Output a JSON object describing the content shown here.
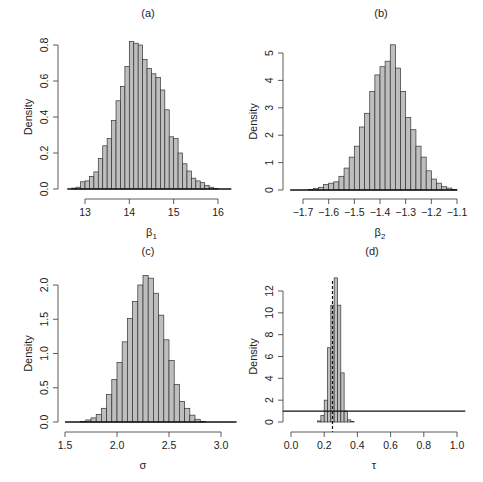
{
  "figure": {
    "panels_count": 4
  },
  "chart_data": [
    {
      "id": "a",
      "type": "bar",
      "title": "(a)",
      "xlabel": "β1",
      "xlabel_main": "β",
      "xlabel_sub": "1",
      "ylabel": "Density",
      "xlim": [
        12.6,
        16.3
      ],
      "ylim": [
        0,
        0.85
      ],
      "xticks": [
        13,
        14,
        15,
        16
      ],
      "xtick_labels": [
        "13",
        "14",
        "15",
        "16"
      ],
      "yticks": [
        0.0,
        0.2,
        0.4,
        0.6,
        0.8
      ],
      "ytick_labels": [
        "0.0",
        "0.2",
        "0.4",
        "0.6",
        "0.8"
      ],
      "bin_width": 0.1,
      "bins_start": [
        12.7,
        12.8,
        12.9,
        13.0,
        13.1,
        13.2,
        13.3,
        13.4,
        13.5,
        13.6,
        13.7,
        13.8,
        13.9,
        14.0,
        14.1,
        14.2,
        14.3,
        14.4,
        14.5,
        14.6,
        14.7,
        14.8,
        14.9,
        15.0,
        15.1,
        15.2,
        15.3,
        15.4,
        15.5,
        15.6,
        15.7,
        15.8,
        15.9
      ],
      "values": [
        0.005,
        0.01,
        0.04,
        0.045,
        0.07,
        0.095,
        0.17,
        0.24,
        0.28,
        0.38,
        0.49,
        0.57,
        0.68,
        0.82,
        0.81,
        0.8,
        0.72,
        0.67,
        0.64,
        0.62,
        0.55,
        0.44,
        0.29,
        0.28,
        0.2,
        0.14,
        0.1,
        0.06,
        0.045,
        0.035,
        0.02,
        0.01,
        0.003
      ],
      "hline": {
        "y": 0,
        "x0": 12.6,
        "x1": 16.3
      },
      "grid": false
    },
    {
      "id": "b",
      "type": "bar",
      "title": "(b)",
      "xlabel": "β2",
      "xlabel_main": "β",
      "xlabel_sub": "2",
      "ylabel": "Density",
      "xlim": [
        -1.75,
        -1.08
      ],
      "ylim": [
        0,
        5.4
      ],
      "xticks": [
        -1.7,
        -1.6,
        -1.5,
        -1.4,
        -1.3,
        -1.2,
        -1.1
      ],
      "xtick_labels": [
        "−1.7",
        "−1.6",
        "−1.5",
        "−1.4",
        "−1.3",
        "−1.2",
        "−1.1"
      ],
      "yticks": [
        0,
        1,
        2,
        3,
        4,
        5
      ],
      "ytick_labels": [
        "0",
        "1",
        "2",
        "3",
        "4",
        "5"
      ],
      "bin_width": 0.02,
      "bins_start": [
        -1.68,
        -1.66,
        -1.64,
        -1.62,
        -1.6,
        -1.58,
        -1.56,
        -1.54,
        -1.52,
        -1.5,
        -1.48,
        -1.46,
        -1.44,
        -1.42,
        -1.4,
        -1.38,
        -1.36,
        -1.34,
        -1.32,
        -1.3,
        -1.28,
        -1.26,
        -1.24,
        -1.22,
        -1.2,
        -1.18,
        -1.16,
        -1.14,
        -1.12
      ],
      "values": [
        0.02,
        0.05,
        0.1,
        0.2,
        0.25,
        0.3,
        0.5,
        0.8,
        1.2,
        1.6,
        2.3,
        2.8,
        3.6,
        4.2,
        4.5,
        4.7,
        5.3,
        4.45,
        3.6,
        2.65,
        2.2,
        1.6,
        1.2,
        0.7,
        0.4,
        0.25,
        0.12,
        0.07,
        0.02
      ],
      "hline": {
        "y": 0,
        "x0": -1.75,
        "x1": -1.1
      },
      "grid": false
    },
    {
      "id": "c",
      "type": "bar",
      "title": "(c)",
      "xlabel": "σ",
      "ylabel": "Density",
      "xlim": [
        1.5,
        3.15
      ],
      "ylim": [
        0,
        2.2
      ],
      "xticks": [
        1.5,
        2.0,
        2.5,
        3.0
      ],
      "xtick_labels": [
        "1.5",
        "2.0",
        "2.5",
        "3.0"
      ],
      "yticks": [
        0.0,
        0.5,
        1.0,
        1.5,
        2.0
      ],
      "ytick_labels": [
        "0.0",
        "0.5",
        "1.0",
        "1.5",
        "2.0"
      ],
      "bin_width": 0.05,
      "bins_start": [
        1.65,
        1.7,
        1.75,
        1.8,
        1.85,
        1.9,
        1.95,
        2.0,
        2.05,
        2.1,
        2.15,
        2.2,
        2.25,
        2.3,
        2.35,
        2.4,
        2.45,
        2.5,
        2.55,
        2.6,
        2.65,
        2.7,
        2.75,
        2.8
      ],
      "values": [
        0.01,
        0.03,
        0.06,
        0.11,
        0.2,
        0.4,
        0.62,
        0.87,
        1.17,
        1.51,
        1.76,
        2.0,
        2.14,
        2.1,
        1.88,
        1.56,
        1.2,
        0.9,
        0.55,
        0.3,
        0.2,
        0.1,
        0.04,
        0.01
      ],
      "hline": {
        "y": 0,
        "x0": 1.5,
        "x1": 3.15
      },
      "grid": false
    },
    {
      "id": "d",
      "type": "bar",
      "title": "(d)",
      "xlabel": "τ",
      "ylabel": "Density",
      "xlim": [
        0.0,
        1.05
      ],
      "ylim": [
        0,
        13.5
      ],
      "xticks": [
        0.0,
        0.2,
        0.4,
        0.6,
        0.8,
        1.0
      ],
      "xtick_labels": [
        "0.0",
        "0.2",
        "0.4",
        "0.6",
        "0.8",
        "1.0"
      ],
      "yticks": [
        0,
        2,
        4,
        6,
        8,
        10,
        12
      ],
      "ytick_labels": [
        "0",
        "2",
        "4",
        "6",
        "8",
        "10",
        "12"
      ],
      "bin_width": 0.02,
      "bins_start": [
        0.16,
        0.18,
        0.2,
        0.22,
        0.24,
        0.26,
        0.28,
        0.3,
        0.32,
        0.34,
        0.36
      ],
      "values": [
        0.1,
        0.6,
        2.0,
        6.8,
        10.7,
        13.2,
        10.7,
        4.5,
        1.0,
        0.2,
        0.05
      ],
      "hline": {
        "y": 1,
        "x0": -0.05,
        "x1": 1.05,
        "label": "uniform prior density"
      },
      "vline_dashed": {
        "x": 0.25
      },
      "grid": false
    }
  ]
}
